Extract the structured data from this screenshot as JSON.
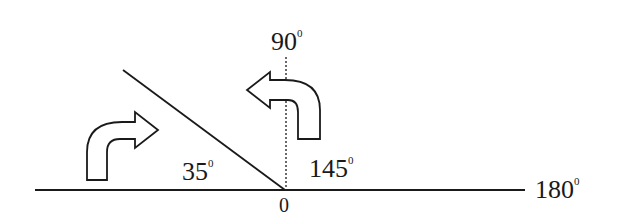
{
  "diagram": {
    "type": "angle-rotation",
    "colors": {
      "stroke": "#1a1a1a",
      "background": "#ffffff"
    },
    "labels": {
      "origin": "0",
      "vertical": "90",
      "right_end": "180",
      "left_angle": "35",
      "right_angle": "145",
      "degree_mark": "0"
    },
    "arrows": [
      {
        "name": "clockwise-arrow",
        "direction": "bent-up-right"
      },
      {
        "name": "counterclockwise-arrow",
        "direction": "bent-up-left"
      }
    ]
  }
}
